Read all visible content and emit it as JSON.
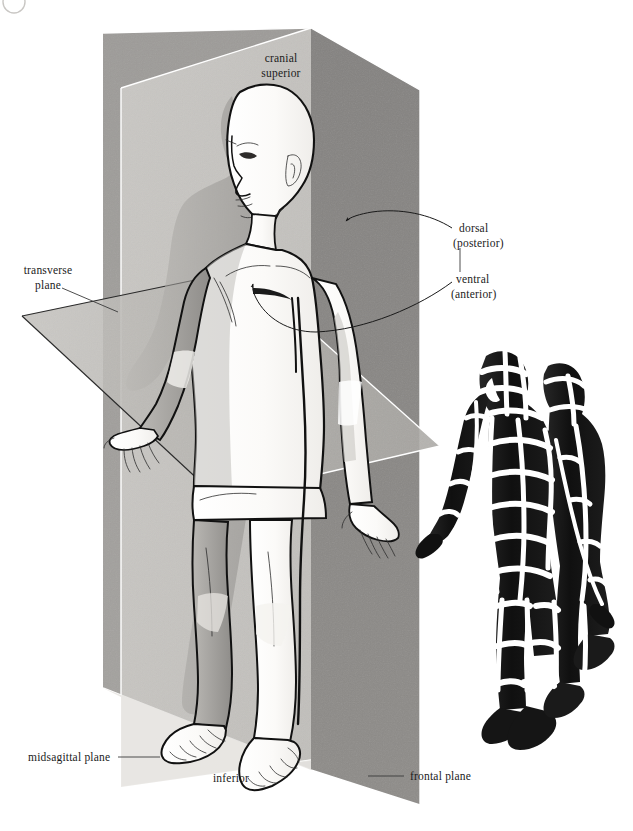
{
  "figure": {
    "corner_mark": "partial-circle-mark",
    "background_color": "#ffffff"
  },
  "labels": {
    "cranial": "cranial",
    "superior": "superior",
    "dorsal": "dorsal",
    "posterior": "(posterior)",
    "ventral": "ventral",
    "anterior": "(anterior)",
    "transverse": "transverse",
    "plane_word": "plane",
    "midsagittal_plane": "midsagittal plane",
    "inferior": "inferior",
    "frontal_plane": "frontal plane"
  },
  "annotations": [
    {
      "name": "cranial-superior",
      "text": "cranial superior",
      "position": "top-center",
      "has_leader": false
    },
    {
      "name": "dorsal-posterior",
      "text": "dorsal (posterior)",
      "position": "right-upper",
      "has_leader": true,
      "leader_style": "curved-arrow"
    },
    {
      "name": "ventral-anterior",
      "text": "ventral (anterior)",
      "position": "right-middle",
      "has_leader": true,
      "leader_style": "curved-arrow"
    },
    {
      "name": "transverse-plane",
      "text": "transverse plane",
      "position": "left-middle",
      "has_leader": true,
      "leader_style": "straight"
    },
    {
      "name": "midsagittal-plane",
      "text": "midsagittal plane",
      "position": "bottom-left",
      "has_leader": true,
      "leader_style": "straight"
    },
    {
      "name": "inferior",
      "text": "inferior",
      "position": "bottom-center",
      "has_leader": false
    },
    {
      "name": "frontal-plane",
      "text": "frontal plane",
      "position": "bottom-right",
      "has_leader": true,
      "leader_style": "straight"
    }
  ],
  "planes": {
    "frontal": {
      "label": "frontal plane",
      "fill": "#7f7f7f",
      "orientation": "vertical-coronal"
    },
    "midsagittal": {
      "label": "midsagittal plane",
      "fill": "#d5d3cf",
      "orientation": "vertical-sagittal"
    },
    "transverse": {
      "label": "transverse plane",
      "fill": "#b4b2ae",
      "orientation": "horizontal"
    }
  },
  "figures": {
    "main": {
      "name": "anatomical-figure-main",
      "description": "standing human figure, bald, three-quarter view facing left, arms at sides with open hands",
      "skin_light": "#fbfaf8",
      "shadow": "#a9a7a3"
    },
    "segmented": {
      "name": "anatomical-figure-segmented",
      "description": "dark silhouette figure banded with white sectional planes",
      "body_color": "#131313",
      "band_color": "#ffffff"
    }
  },
  "colors": {
    "frontal_plane": "#7f7f7f",
    "frontal_plane_light": "#9b9996",
    "midsagittal_plane": "#d9d7d3",
    "transverse_plane": "#b6b4b0",
    "text": "#1b1b1b",
    "leader": "#3a3a3a",
    "outline": "#111111"
  }
}
